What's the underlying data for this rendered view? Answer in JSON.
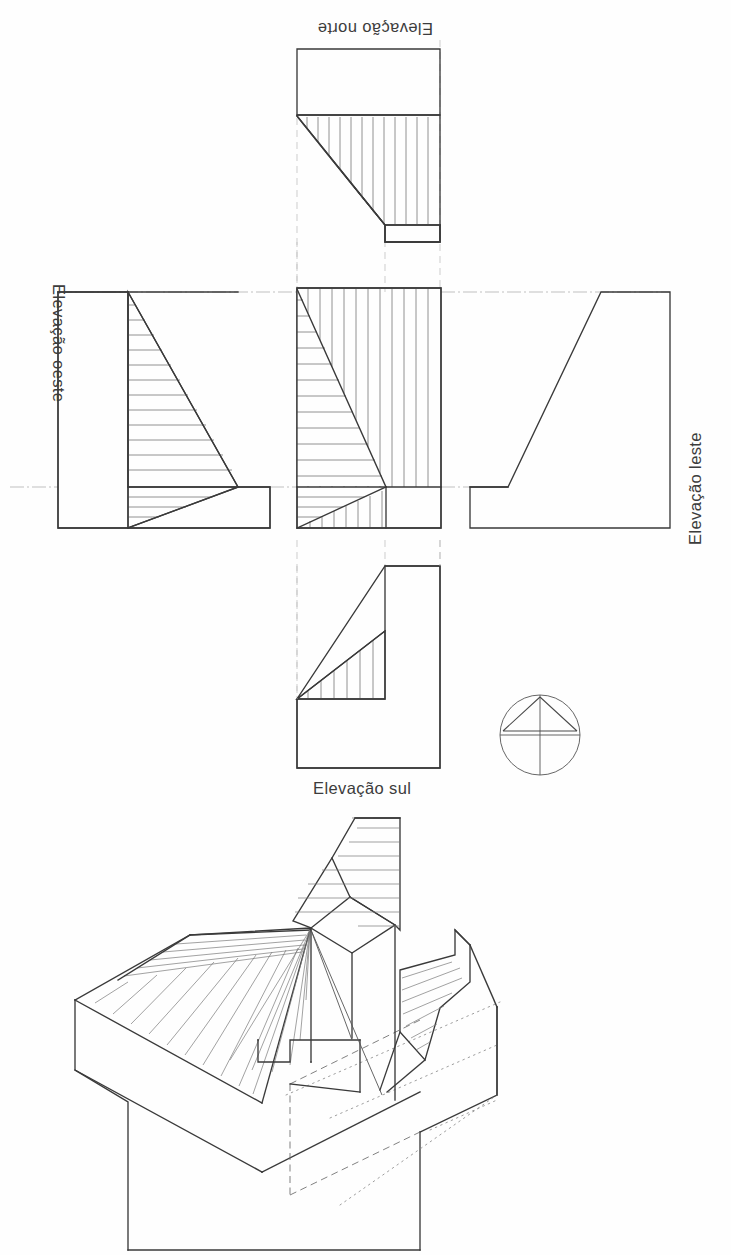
{
  "sheet": {
    "kind": "orthographic-projection-plate",
    "background_color": "#fefefe",
    "line_color": "#3a3a3a",
    "hatch_color": "#6e6e6e",
    "width_px": 731,
    "height_px": 1255
  },
  "labels": {
    "north": "Elevação norte",
    "south": "Elevação sul",
    "west": "Elevação oeste",
    "east": "Elevação leste"
  },
  "label_orientation": {
    "north": "rotated-180",
    "south": "upright",
    "west": "rotated-90-cw",
    "east": "rotated-90-ccw"
  },
  "views": [
    {
      "id": "north-elevation",
      "label": "Elevação norte",
      "position": "top",
      "hatched": true,
      "hatch_direction": "vertical",
      "notes": "upper plain rectangle over hatched body cut by a descending diagonal from upper-left, with a small rectangle at lower right"
    },
    {
      "id": "west-elevation",
      "label": "Elevação oeste",
      "position": "left",
      "hatched": true,
      "hatch_direction": "horizontal",
      "notes": "plain left panel, hatched trapezoid with diagonal falling to the right, low right step"
    },
    {
      "id": "plan-view",
      "label": "",
      "position": "center",
      "hatched": true,
      "hatch_direction": "mixed",
      "notes": "central plan: vertical hatch on right half, horizontal hatch on left half, two opposing diagonals meeting at a notch"
    },
    {
      "id": "east-elevation",
      "label": "Elevação leste",
      "position": "right",
      "hatched": false,
      "hatch_direction": "none",
      "notes": "unhatched stepped outline, diagonal rising to the right up to a top plateau"
    },
    {
      "id": "south-elevation",
      "label": "Elevação sul",
      "position": "bottom",
      "hatched": true,
      "hatch_direction": "vertical",
      "notes": "tall right rectangle with hatched triangle to its left sitting on a base block"
    },
    {
      "id": "axonometric-view",
      "label": "",
      "position": "lower",
      "hatched": true,
      "hatch_direction": "diagonal",
      "notes": "isometric of the volume: hatched sloping roof planes, vertical tower/chimney prism, hatched cut planes, hidden dashed and dotted construction edges"
    }
  ],
  "symbols": [
    {
      "id": "projection-symbol",
      "name": "projection-method-symbol",
      "description": "circle with inscribed triangle apex-up and crossed centre axes"
    }
  ]
}
